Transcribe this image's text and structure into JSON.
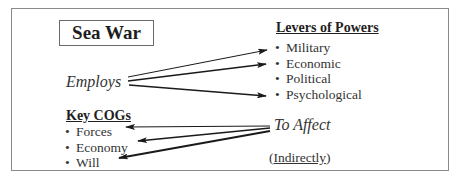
{
  "diagram": {
    "title": "Sea War",
    "employs_label": "Employs",
    "to_affect_label": "To Affect",
    "indirectly": {
      "open": "(",
      "text": "Indirectly",
      "close": ")"
    },
    "levers": {
      "heading": "Levers of Powers",
      "bullet": "•",
      "items": [
        "Military",
        "Economic",
        "Political",
        "Psychological"
      ]
    },
    "cogs": {
      "heading": "Key COGs",
      "bullet": "•",
      "items": [
        "Forces",
        "Economy",
        "Will"
      ]
    },
    "edges": [
      {
        "from": "Employs",
        "to": "Military"
      },
      {
        "from": "Employs",
        "to": "Economic"
      },
      {
        "from": "Employs",
        "to": "Psychological"
      },
      {
        "from": "To Affect",
        "to": "Forces"
      },
      {
        "from": "To Affect",
        "to": "Economy"
      },
      {
        "from": "To Affect",
        "to": "Will"
      }
    ],
    "colors": {
      "border": "#8a8a8a",
      "text": "#2a2a2a",
      "arrow": "#1a1a1a"
    }
  }
}
